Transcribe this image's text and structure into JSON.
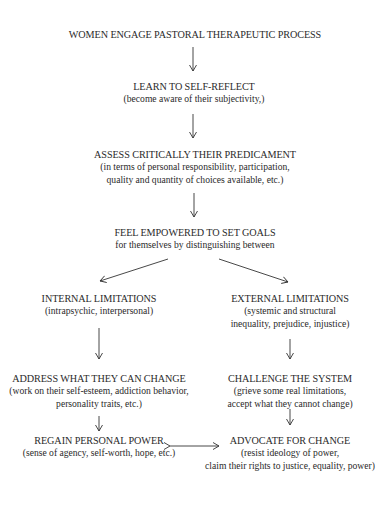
{
  "diagram": {
    "nodes": [
      {
        "id": "engage",
        "title": "WOMEN ENGAGE PASTORAL THERAPEUTIC PROCESS",
        "sub": []
      },
      {
        "id": "reflect",
        "title": "LEARN TO SELF-REFLECT",
        "sub": [
          "(become aware of their subjectivity,)"
        ]
      },
      {
        "id": "assess",
        "title": "ASSESS CRITICALLY THEIR PREDICAMENT",
        "sub": [
          "(in terms of personal responsibility, participation,",
          "quality and quantity of choices available, etc.)"
        ]
      },
      {
        "id": "goals",
        "title": "FEEL EMPOWERED TO SET GOALS",
        "sub": [
          "for themselves by distinguishing between"
        ]
      },
      {
        "id": "internal",
        "title": "INTERNAL LIMITATIONS",
        "sub": [
          "(intrapsychic, interpersonal)"
        ]
      },
      {
        "id": "external",
        "title": "EXTERNAL LIMITATIONS",
        "sub": [
          "(systemic and structural",
          "inequality, prejudice, injustice)"
        ]
      },
      {
        "id": "address",
        "title": "ADDRESS WHAT THEY CAN CHANGE",
        "sub": [
          "(work on their self-esteem, addiction behavior,",
          "personality traits, etc.)"
        ]
      },
      {
        "id": "challenge",
        "title": "CHALLENGE THE SYSTEM",
        "sub": [
          "(grieve some real limitations,",
          "accept what they cannot change)"
        ]
      },
      {
        "id": "regain",
        "title": "REGAIN PERSONAL POWER",
        "sub": [
          "(sense of agency, self-worth, hope, etc.)"
        ]
      },
      {
        "id": "advocate",
        "title": "ADVOCATE FOR CHANGE",
        "sub": [
          "(resist ideology of power,",
          "claim their rights to justice, equality, power)"
        ]
      }
    ],
    "edges": [
      {
        "from": "engage",
        "to": "reflect"
      },
      {
        "from": "reflect",
        "to": "assess"
      },
      {
        "from": "assess",
        "to": "goals"
      },
      {
        "from": "goals",
        "to": "internal"
      },
      {
        "from": "goals",
        "to": "external"
      },
      {
        "from": "internal",
        "to": "address"
      },
      {
        "from": "external",
        "to": "challenge"
      },
      {
        "from": "address",
        "to": "regain"
      },
      {
        "from": "challenge",
        "to": "advocate"
      },
      {
        "from": "regain",
        "to": "advocate",
        "bidirectional": true
      }
    ]
  }
}
